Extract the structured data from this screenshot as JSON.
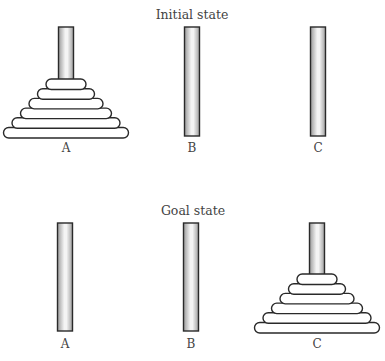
{
  "diagram": {
    "type": "tower-of-hanoi",
    "disk_count": 6,
    "colors": {
      "outline": "#2a2a2a",
      "peg_edge": "#9a9a9a",
      "peg_center": "#f4f4f4",
      "disk_fill": "#ffffff",
      "text": "#444444"
    },
    "panels": [
      {
        "id": "initial",
        "title": "Initial state",
        "title_x": 192,
        "title_y": 19,
        "peg_top": 27,
        "peg_bottom": 136,
        "label_y": 152,
        "pegs": [
          {
            "label": "A",
            "cx": 66,
            "disks": [
              6,
              5,
              4,
              3,
              2,
              1
            ]
          },
          {
            "label": "B",
            "cx": 192,
            "disks": []
          },
          {
            "label": "C",
            "cx": 318,
            "disks": []
          }
        ]
      },
      {
        "id": "goal",
        "title": "Goal state",
        "title_x": 193,
        "title_y": 215,
        "peg_top": 223,
        "peg_bottom": 331,
        "label_y": 348,
        "pegs": [
          {
            "label": "A",
            "cx": 65,
            "disks": []
          },
          {
            "label": "B",
            "cx": 191,
            "disks": []
          },
          {
            "label": "C",
            "cx": 317,
            "disks": [
              6,
              5,
              4,
              3,
              2,
              1
            ]
          }
        ]
      }
    ]
  }
}
